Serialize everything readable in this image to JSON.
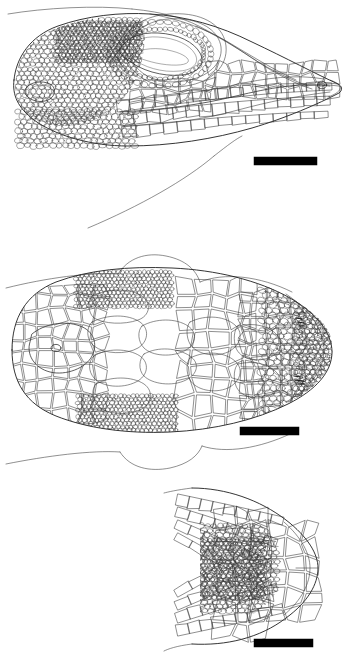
{
  "figure": {
    "caption": "",
    "background_color": "#ffffff",
    "ink_color": "#1a1a1a",
    "scalebar_color": "#000000",
    "width_px": 349,
    "height_px": 659
  },
  "panels": [
    {
      "id": "lateral",
      "view_label": "lateral view of head",
      "subject": "lizard head",
      "orientation": "snout to the right",
      "features": [
        "supraocular granular scales",
        "orbital ring of ciliary scales",
        "eye opening",
        "tympanum",
        "supralabial scale row",
        "infralabial scale row",
        "nostril",
        "rostral scale",
        "neck fold outline"
      ],
      "scalebar": {
        "label": "",
        "x": 254,
        "y": 157,
        "width": 63,
        "height": 8
      }
    },
    {
      "id": "dorsal",
      "view_label": "dorsal view of head",
      "subject": "lizard head",
      "orientation": "snout to the right",
      "features": [
        "interparietal scale with pineal foramen",
        "parietal scales",
        "frontal scale",
        "prefrontal scales",
        "supraocular granular patches",
        "occipital granular scales",
        "rostral scale",
        "canthal scale row",
        "nuchal scales"
      ],
      "scalebar": {
        "label": "",
        "x": 240,
        "y": 427,
        "width": 59,
        "height": 8
      }
    },
    {
      "id": "ventral",
      "view_label": "ventral view of chin and throat",
      "subject": "lizard chin",
      "orientation": "snout to the right",
      "features": [
        "mental scale",
        "postmental scales",
        "chin shields",
        "gular granules",
        "infralabial scale row"
      ],
      "scalebar": {
        "label": "",
        "x": 254,
        "y": 639,
        "width": 59,
        "height": 8
      }
    }
  ]
}
